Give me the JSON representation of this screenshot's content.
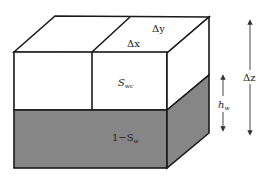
{
  "diagram": {
    "labels": {
      "dy": "Δy",
      "dx": "Δx",
      "swc": "S",
      "swc_sub": "wc",
      "one_minus": "1−S",
      "one_minus_sub": "w",
      "hw": "h",
      "hw_sub": "w",
      "dz": "Δz"
    },
    "colors": {
      "stroke": "#1a1a1a",
      "dry": "#ffffff",
      "wet": "#868686",
      "arrow": "#333333"
    }
  }
}
